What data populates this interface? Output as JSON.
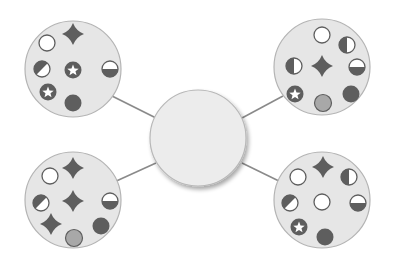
{
  "colors": {
    "background": "#ffffff",
    "bubble_fill": "#e6e6e6",
    "bubble_stroke": "#b4b4b4",
    "center_fill": "#ececec",
    "center_stroke": "#b8b8b8",
    "connector": "#8a8a8a",
    "dark": "#5e5e5e",
    "mid_gray": "#a8a8a8",
    "white": "#ffffff"
  },
  "center": {
    "cx": 198,
    "cy": 138,
    "r": 48,
    "label": ""
  },
  "bubbles": [
    {
      "id": "top-left",
      "cx": 73,
      "cy": 69,
      "r": 48,
      "connector": {
        "x1": 112,
        "y1": 96,
        "x2": 156,
        "y2": 118
      },
      "symbols": [
        {
          "type": "ring",
          "x": 47,
          "y": 43
        },
        {
          "type": "star4",
          "x": 73,
          "y": 34
        },
        {
          "type": "half-diagonal",
          "x": 42,
          "y": 69
        },
        {
          "type": "star-circle",
          "x": 73,
          "y": 70
        },
        {
          "type": "half-bottom",
          "x": 110,
          "y": 69
        },
        {
          "type": "star-circle",
          "x": 48,
          "y": 92
        },
        {
          "type": "filled",
          "x": 73,
          "y": 103
        }
      ]
    },
    {
      "id": "top-right",
      "cx": 322,
      "cy": 67,
      "r": 48,
      "connector": {
        "x1": 283,
        "y1": 96,
        "x2": 242,
        "y2": 118
      },
      "symbols": [
        {
          "type": "ring",
          "x": 322,
          "y": 35
        },
        {
          "type": "half-left",
          "x": 347,
          "y": 45
        },
        {
          "type": "half-left",
          "x": 294,
          "y": 66
        },
        {
          "type": "star4",
          "x": 322,
          "y": 66
        },
        {
          "type": "half-bottom",
          "x": 357,
          "y": 67
        },
        {
          "type": "star-circle",
          "x": 295,
          "y": 94
        },
        {
          "type": "gray",
          "x": 323,
          "y": 103
        },
        {
          "type": "filled",
          "x": 351,
          "y": 94
        }
      ]
    },
    {
      "id": "bottom-left",
      "cx": 73,
      "cy": 200,
      "r": 48,
      "connector": {
        "x1": 112,
        "y1": 183,
        "x2": 156,
        "y2": 163
      },
      "symbols": [
        {
          "type": "ring",
          "x": 50,
          "y": 176
        },
        {
          "type": "star4",
          "x": 73,
          "y": 168
        },
        {
          "type": "half-diagonal",
          "x": 41,
          "y": 203
        },
        {
          "type": "star4",
          "x": 73,
          "y": 201
        },
        {
          "type": "half-bottom",
          "x": 110,
          "y": 201
        },
        {
          "type": "star4",
          "x": 51,
          "y": 224
        },
        {
          "type": "gray",
          "x": 74,
          "y": 238
        },
        {
          "type": "filled",
          "x": 101,
          "y": 226
        }
      ]
    },
    {
      "id": "bottom-right",
      "cx": 322,
      "cy": 200,
      "r": 48,
      "connector": {
        "x1": 283,
        "y1": 183,
        "x2": 242,
        "y2": 163
      },
      "symbols": [
        {
          "type": "ring",
          "x": 298,
          "y": 177
        },
        {
          "type": "star4",
          "x": 323,
          "y": 167
        },
        {
          "type": "half-left",
          "x": 349,
          "y": 177
        },
        {
          "type": "half-diagonal",
          "x": 290,
          "y": 203
        },
        {
          "type": "ring",
          "x": 322,
          "y": 202
        },
        {
          "type": "half-bottom",
          "x": 358,
          "y": 203
        },
        {
          "type": "star-circle",
          "x": 299,
          "y": 227
        },
        {
          "type": "filled",
          "x": 325,
          "y": 237
        }
      ]
    }
  ]
}
